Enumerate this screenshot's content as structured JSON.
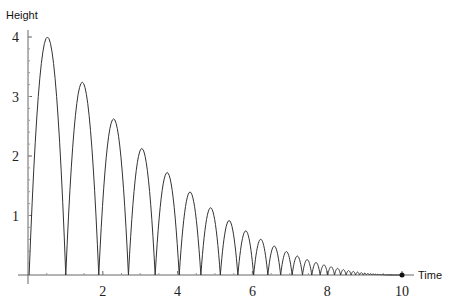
{
  "chart_data": {
    "type": "line",
    "title": "",
    "xlabel": "Time",
    "ylabel": "Height",
    "xlim": [
      0,
      10
    ],
    "ylim": [
      0,
      4
    ],
    "x_ticks": [
      2,
      4,
      6,
      8,
      10
    ],
    "y_ticks": [
      1,
      2,
      3,
      4
    ],
    "grid": false,
    "legend": null,
    "series": [
      {
        "name": "Bouncing ball height",
        "model": "successive parabolic arches, peak heights decay by factor 0.81 each bounce (restitution 0.9)",
        "first_peak_height": 4.0,
        "first_arch_start": 0.03,
        "first_arch_duration": 0.98,
        "bounce_landing_times": [
          1.01,
          1.89,
          2.72,
          3.44,
          4.08
        ],
        "peak_heights": [
          4.0,
          3.24,
          2.62,
          2.12,
          1.72,
          1.39,
          1.13,
          0.91,
          0.74,
          0.6,
          0.48,
          0.39
        ]
      }
    ],
    "end_marker": {
      "x": 10,
      "y": 0
    }
  },
  "labels": {
    "y_axis_title": "Height",
    "x_axis_title": "Time",
    "y_ticks": [
      "1",
      "2",
      "3",
      "4"
    ],
    "x_ticks": [
      "2",
      "4",
      "6",
      "8",
      "10"
    ]
  }
}
